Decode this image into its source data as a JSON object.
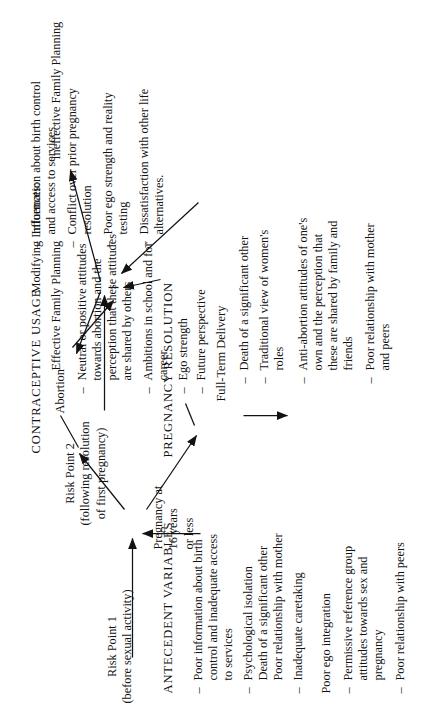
{
  "figure": {
    "risk_point_1": {
      "title": "Risk Point 1",
      "subtitle": "(before sexual activity)"
    },
    "risk_point_2": {
      "title": "Risk Point 2",
      "subtitle_line1": "(following resolution",
      "subtitle_line2": "of first pregnancy)"
    }
  },
  "antecedent": {
    "heading": "ANTECEDENT  VARIABLES",
    "items": [
      "Poor information about birth control and inadequate access to services",
      "Psychological isolation Death of a significant other Poor relationship with mother",
      "Inadequate caretaking",
      "Permissive reference group attitudes towards sex and pregnancy",
      "Poor relationship with peers"
    ],
    "item_lines": [
      [
        "Poor information about birth",
        "control and inadequate access",
        "to services"
      ],
      [
        "Psychological isolation",
        "Death of a significant other",
        "Poor relationship with mother"
      ],
      [
        "Inadequate caretaking"
      ],
      [
        "Permissive reference group",
        "attitudes towards sex and",
        "pregnancy"
      ],
      [
        "Poor relationship with peers"
      ]
    ],
    "mediator": "Poor ego integration"
  },
  "outcome1": {
    "lines": [
      "Pregnancy at",
      "16 years",
      "or less"
    ]
  },
  "resolution": {
    "heading": "PREGNANCY  RESOLUTION",
    "branch_a": "Abortion",
    "branch_a_items": [
      [
        "Neutral or positive attitudes",
        "towards abortion and the",
        "perception that these attitudes",
        "are shared by others"
      ],
      [
        "Ambitions in school and for",
        "career"
      ],
      [
        "Ego strength"
      ],
      [
        "Future perspective"
      ]
    ],
    "branch_b": "Full-Term Delivery",
    "branch_b_items": [
      [
        "Death of a significant other"
      ],
      [
        "Traditional view of women's",
        "roles"
      ],
      [
        "Anti-abortion attitudes of one's",
        "own and the perception that",
        "these are shared by family and",
        "friends"
      ],
      [
        "Poor relationship with mother",
        "and peers"
      ]
    ]
  },
  "contraceptive": {
    "heading": "CONTRACEPTIVE  USAGE",
    "outcome_positive": "Effective Family Planning",
    "modifying_label": "Modifying Influences:",
    "modifying_items": [
      [
        "Information about birth control",
        "and access to services"
      ],
      [
        "Conflict over prior pregnancy",
        "resolution"
      ],
      [
        "Poor ego strength and reality",
        "testing"
      ],
      [
        "Dissatisfaction with other life",
        "alternatives."
      ]
    ],
    "outcome_negative": "Ineffective Family Planning"
  },
  "glyphs": {
    "dash": "–"
  },
  "colors": {
    "ink": "#121212",
    "paper": "#ffffff"
  }
}
